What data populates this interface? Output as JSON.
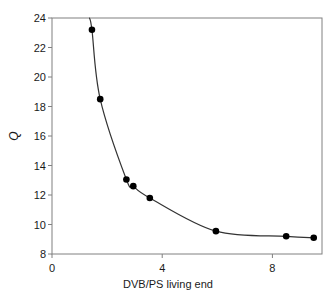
{
  "chart_data": {
    "type": "scatter",
    "title": "",
    "xlabel": "DVB/PS living end",
    "ylabel": "Q",
    "xlim": [
      0,
      9.8
    ],
    "ylim": [
      8,
      24
    ],
    "xticks": [
      "0",
      "4",
      "8"
    ],
    "xtick_values": [
      0,
      4,
      8
    ],
    "yticks": [
      "8",
      "10",
      "12",
      "14",
      "16",
      "18",
      "20",
      "22",
      "24"
    ],
    "ytick_values": [
      8,
      10,
      12,
      14,
      16,
      18,
      20,
      22,
      24
    ],
    "grid": false,
    "legend": false,
    "marker": "filled-circle",
    "marker_color": "#000000",
    "line_color": "#333333",
    "frame_color": "#808080",
    "x": [
      1.45,
      1.75,
      2.7,
      2.95,
      3.55,
      5.95,
      8.5,
      9.5
    ],
    "y": [
      23.2,
      18.5,
      13.05,
      12.6,
      11.8,
      9.55,
      9.2,
      9.1
    ],
    "points": [
      {
        "x": 1.45,
        "y": 23.2
      },
      {
        "x": 1.75,
        "y": 18.5
      },
      {
        "x": 2.7,
        "y": 13.05
      },
      {
        "x": 2.95,
        "y": 12.6
      },
      {
        "x": 3.55,
        "y": 11.8
      },
      {
        "x": 5.95,
        "y": 9.55
      },
      {
        "x": 8.5,
        "y": 9.2
      },
      {
        "x": 9.5,
        "y": 9.1
      }
    ]
  }
}
